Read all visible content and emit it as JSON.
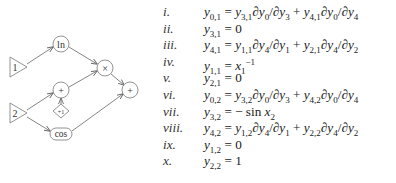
{
  "graph": {
    "nodes": [
      {
        "id": "x1",
        "shape": "triangle",
        "label": "1"
      },
      {
        "id": "x2",
        "shape": "triangle",
        "label": "2"
      },
      {
        "id": "ln",
        "shape": "circle",
        "label": "ln"
      },
      {
        "id": "plus_left",
        "shape": "circle",
        "label": "+"
      },
      {
        "id": "plus_one",
        "shape": "diamond",
        "label": "+1"
      },
      {
        "id": "cos",
        "shape": "rounded-rect",
        "label": "cos"
      },
      {
        "id": "times",
        "shape": "circle",
        "label": "×"
      },
      {
        "id": "plus_right",
        "shape": "circle",
        "label": "+"
      }
    ],
    "edges": [
      [
        "x1",
        "ln"
      ],
      [
        "x2",
        "plus_left"
      ],
      [
        "x2",
        "cos"
      ],
      [
        "plus_one",
        "plus_left"
      ],
      [
        "ln",
        "times"
      ],
      [
        "plus_left",
        "times"
      ],
      [
        "times",
        "plus_right"
      ],
      [
        "cos",
        "plus_right"
      ]
    ],
    "color": "#555555"
  },
  "equations": [
    {
      "label": "i.",
      "text": "y0,1 = y3,1∂y0/∂y3 + y4,1∂y0/∂y4"
    },
    {
      "label": "ii.",
      "text": "y3,1 = 0"
    },
    {
      "label": "iii.",
      "text": "y4,1 = y1,1∂y4/∂y1 + y2,1∂y4/∂y2"
    },
    {
      "label": "iv.",
      "text": "y1,1 = x1^−1"
    },
    {
      "label": "v.",
      "text": "y2,1 = 0"
    },
    {
      "label": "vi.",
      "text": "y0,2 = y3,2∂y0/∂y3 + y4,2∂y0/∂y4"
    },
    {
      "label": "vii.",
      "text": "y3,2 = − sin x2"
    },
    {
      "label": "viii.",
      "text": "y4,2 = y1,2∂y4/∂y1 + y2,2∂y4/∂y2"
    },
    {
      "label": "ix.",
      "text": "y1,2 = 0"
    },
    {
      "label": "x.",
      "text": "y2,2 = 1"
    }
  ]
}
